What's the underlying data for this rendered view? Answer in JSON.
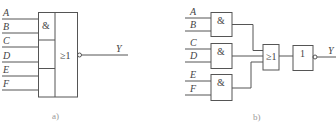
{
  "diagram_a": {
    "caption": "a)",
    "inputs": [
      "A",
      "B",
      "C",
      "D",
      "E",
      "F"
    ],
    "and_symbol": "&",
    "or_symbol": "≥1",
    "output": "Y",
    "description": "AND-OR-INVERT compound gate: three 2-input AND sections feeding a NOR (≥1 with inverted output)"
  },
  "diagram_b": {
    "caption": "b)",
    "and_gates": [
      {
        "symbol": "&",
        "inputs": [
          "A",
          "B"
        ]
      },
      {
        "symbol": "&",
        "inputs": [
          "C",
          "D"
        ]
      },
      {
        "symbol": "&",
        "inputs": [
          "E",
          "F"
        ]
      }
    ],
    "or_gate": {
      "symbol": "≥1"
    },
    "not_gate": {
      "symbol": "1"
    },
    "output": "Y"
  }
}
